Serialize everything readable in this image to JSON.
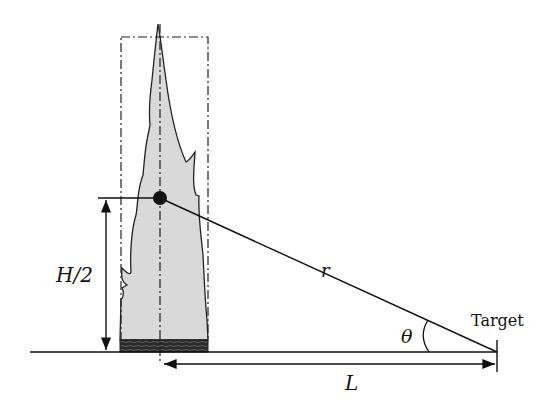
{
  "diagram": {
    "labels": {
      "half_height": "H/2",
      "radius": "r",
      "angle": "θ",
      "target": "Target",
      "distance": "L"
    },
    "colors": {
      "line": "#111111",
      "flame_fill": "#d9d9d9",
      "fuel_bed": "#2a2a2a",
      "background": "#ffffff"
    },
    "elements": [
      "ground-line",
      "flame",
      "fuel-bed",
      "dash-dot-bounding-box",
      "flame-centerline",
      "point-source-dot",
      "height-dimension-arrow",
      "radius-line",
      "angle-arc",
      "target-marker",
      "distance-dimension-arrow"
    ]
  }
}
